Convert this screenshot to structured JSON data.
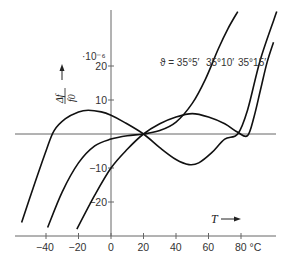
{
  "chart_data": {
    "type": "line",
    "title": "",
    "xlabel": "T",
    "xunit": "°C",
    "ylabel": "Δf / f0",
    "ylabel_numerator": "Δf",
    "ylabel_denominator": "f0",
    "yunit": "·10⁻⁶",
    "xlim": [
      -59,
      100
    ],
    "ylim": [
      -28,
      38
    ],
    "grid": false,
    "x_ticks": [
      -40,
      -20,
      0,
      20,
      40,
      60,
      80
    ],
    "x_tick_labels": [
      "−40",
      "−20",
      "0",
      "20",
      "40",
      "60",
      "80 °C"
    ],
    "y_ticks": [
      20,
      10,
      -10,
      -20
    ],
    "y_tick_labels": [
      "20",
      "10",
      "−10",
      "−20"
    ],
    "legend_prefix": "ϑ = ",
    "series": [
      {
        "name": "35°5′",
        "label": "ϑ = 35°5′",
        "points": [
          [
            -55,
            -26
          ],
          [
            -48,
            -16
          ],
          [
            -40,
            -5
          ],
          [
            -35,
            1
          ],
          [
            -28,
            4.5
          ],
          [
            -20,
            6.5
          ],
          [
            -14,
            7
          ],
          [
            -6,
            6.5
          ],
          [
            0,
            5.5
          ],
          [
            8,
            3.5
          ],
          [
            20,
            0
          ],
          [
            30,
            -4
          ],
          [
            40,
            -7.5
          ],
          [
            48,
            -9
          ],
          [
            54,
            -8.5
          ],
          [
            62,
            -5.5
          ],
          [
            70,
            -1.5
          ],
          [
            78,
            0
          ],
          [
            84,
            7
          ],
          [
            92,
            22
          ],
          [
            102,
            36
          ]
        ]
      },
      {
        "name": "35°10′",
        "label": "35°10′",
        "points": [
          [
            -39,
            -27.5
          ],
          [
            -30,
            -17
          ],
          [
            -20,
            -8.5
          ],
          [
            -10,
            -3.5
          ],
          [
            0,
            -1.5
          ],
          [
            10,
            -0.5
          ],
          [
            20,
            0
          ],
          [
            30,
            1
          ],
          [
            40,
            3.5
          ],
          [
            50,
            9
          ],
          [
            58,
            16
          ],
          [
            66,
            25
          ],
          [
            72,
            31
          ],
          [
            78,
            36
          ]
        ]
      },
      {
        "name": "35°15′",
        "label": "35°15′",
        "points": [
          [
            -21,
            -28
          ],
          [
            -10,
            -18
          ],
          [
            0,
            -10
          ],
          [
            10,
            -4.5
          ],
          [
            20,
            0
          ],
          [
            30,
            3
          ],
          [
            40,
            5
          ],
          [
            50,
            6
          ],
          [
            60,
            5
          ],
          [
            70,
            3
          ],
          [
            78,
            0.5
          ],
          [
            84,
            -0.5
          ],
          [
            88,
            5
          ],
          [
            92,
            13
          ],
          [
            96,
            21
          ],
          [
            100,
            27
          ]
        ]
      }
    ],
    "annotations": [
      "·10⁻⁶",
      "T ⟶",
      "Δf/f0 ↑"
    ]
  }
}
